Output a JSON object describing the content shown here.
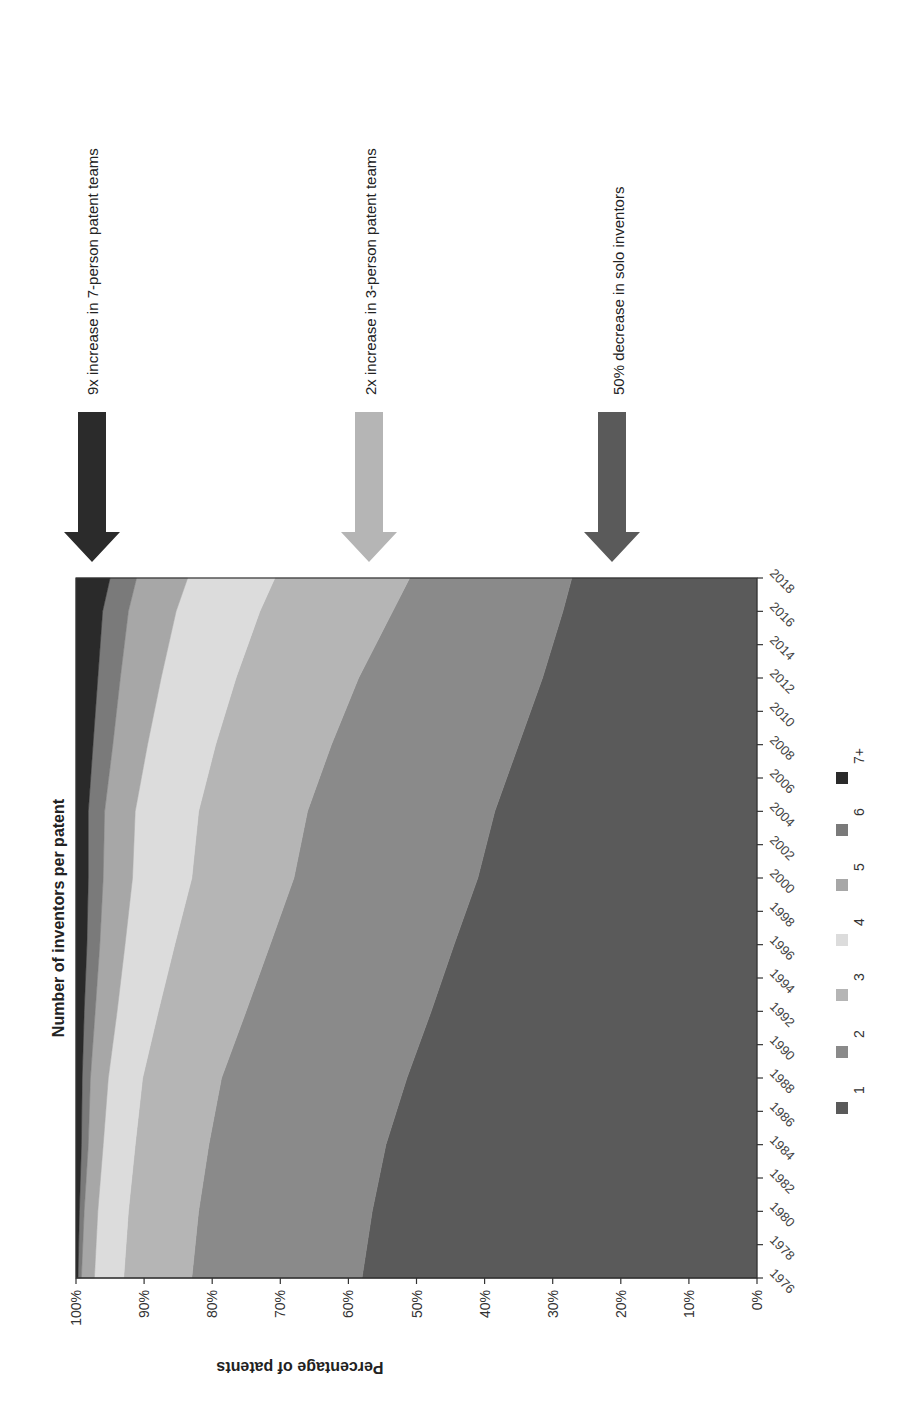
{
  "chart_data": {
    "type": "area",
    "stacked": true,
    "normalized_percent": true,
    "orientation_note": "figure rotated 90 degrees counterclockwise on the page",
    "title": "Number of inventors per patent",
    "xlabel": "",
    "ylabel": "Percentage of patents",
    "ylim": [
      0,
      100
    ],
    "y_ticks": [
      "0%",
      "10%",
      "20%",
      "30%",
      "40%",
      "50%",
      "60%",
      "70%",
      "80%",
      "90%",
      "100%"
    ],
    "x_ticks": [
      "1976",
      "1978",
      "1980",
      "1982",
      "1984",
      "1986",
      "1988",
      "1990",
      "1992",
      "1994",
      "1996",
      "1998",
      "2000",
      "2002",
      "2004",
      "2006",
      "2008",
      "2010",
      "2012",
      "2014",
      "2016",
      "2018"
    ],
    "x": [
      1976,
      1980,
      1984,
      1988,
      1992,
      1996,
      2000,
      2004,
      2008,
      2012,
      2016,
      2018
    ],
    "legend": [
      "1",
      "2",
      "3",
      "4",
      "5",
      "6",
      "7+"
    ],
    "legend_position": "bottom",
    "series": [
      {
        "name": "1",
        "color": "#5a5a5a",
        "values": [
          58.0,
          56.5,
          54.5,
          51.0,
          47.5,
          44.5,
          41.0,
          38.5,
          35.0,
          31.5,
          28.5,
          27.2
        ]
      },
      {
        "name": "2",
        "color": "#8a8a8a",
        "values": [
          25.0,
          25.5,
          26.0,
          27.0,
          27.0,
          27.0,
          27.0,
          27.5,
          27.5,
          27.0,
          25.0,
          23.8
        ]
      },
      {
        "name": "3",
        "color": "#b5b5b5",
        "values": [
          10.0,
          10.3,
          10.8,
          11.5,
          12.8,
          14.0,
          15.0,
          16.0,
          17.0,
          18.0,
          19.5,
          19.8
        ]
      },
      {
        "name": "4",
        "color": "#dcdcdc",
        "values": [
          4.3,
          4.5,
          4.7,
          5.0,
          6.0,
          7.3,
          8.7,
          9.3,
          10.0,
          11.0,
          12.3,
          12.8
        ]
      },
      {
        "name": "5",
        "color": "#a7a7a7",
        "values": [
          1.9,
          2.0,
          2.2,
          2.6,
          3.2,
          3.7,
          4.3,
          4.5,
          5.1,
          6.0,
          7.0,
          7.5
        ]
      },
      {
        "name": "6",
        "color": "#7a7a7a",
        "values": [
          0.5,
          0.7,
          1.0,
          1.2,
          1.6,
          1.9,
          2.2,
          2.4,
          2.9,
          3.3,
          3.8,
          3.9
        ]
      },
      {
        "name": "7+",
        "color": "#2a2a2a",
        "values": [
          0.3,
          0.5,
          0.8,
          0.9,
          1.2,
          1.6,
          1.8,
          1.8,
          2.5,
          3.2,
          3.9,
          5.0
        ]
      }
    ],
    "annotations": [
      {
        "text": "9x increase in 7-person patent teams",
        "arrow_color": "#2b2b2b",
        "points_to": "7+"
      },
      {
        "text": "2x increase in 3-person patent teams",
        "arrow_color": "#b5b5b5",
        "points_to": "3"
      },
      {
        "text": "50% decrease in solo inventors",
        "arrow_color": "#5a5a5a",
        "points_to": "1"
      }
    ]
  }
}
